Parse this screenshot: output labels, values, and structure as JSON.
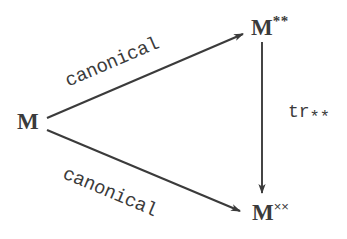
{
  "diagram": {
    "type": "commutative-diagram",
    "background_color": "#ffffff",
    "ink_color": "#3b3b3b",
    "nodes": [
      {
        "id": "M",
        "base": "M",
        "superscript": "",
        "label_text": "M",
        "x": 27,
        "y": 128
      },
      {
        "id": "M**",
        "base": "M",
        "superscript": "**",
        "label_text": "M**",
        "x": 268,
        "y": 33
      },
      {
        "id": "Mxx",
        "base": "M",
        "superscript": "××",
        "label_text": "M××",
        "x": 270,
        "y": 218
      }
    ],
    "edges": [
      {
        "id": "M-to-M**",
        "from": "M",
        "to": "M**",
        "label": "canonical",
        "arrowhead": "at-target"
      },
      {
        "id": "M-to-Mxx",
        "from": "M",
        "to": "Mxx",
        "label": "canonical",
        "arrowhead": "at-target"
      },
      {
        "id": "M**-to-Mxx",
        "from": "M**",
        "to": "Mxx",
        "label": "tr**",
        "arrowhead": "at-target"
      }
    ],
    "labels": {
      "canonical_top": "canonical",
      "canonical_bottom": "canonical",
      "tr_base": "tr",
      "tr_subscript": "**"
    },
    "node_text": {
      "m_left": "M",
      "m_top_right_base": "M",
      "m_top_right_sup": "**",
      "m_bottom_right_base": "M",
      "m_bottom_right_sup": "××"
    }
  }
}
